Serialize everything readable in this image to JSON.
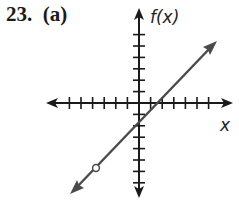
{
  "header": {
    "problem_label": "23.  (a)"
  },
  "colors": {
    "axis": "#1a1a1a",
    "line": "#4a4a4a",
    "background": "#ffffff"
  },
  "chart_data": {
    "type": "line",
    "title": "23. (a)",
    "xlabel": "x",
    "ylabel": "f(x)",
    "xlim": [
      -8,
      8
    ],
    "ylim": [
      -8,
      8
    ],
    "x_ticks_left": 6,
    "x_ticks_right": 6,
    "y_ticks_up": 6,
    "y_ticks_down": 7,
    "grid": false,
    "series": [
      {
        "name": "f(x)",
        "equation": "f(x) = x - 1",
        "slope": 1,
        "y_intercept": -1,
        "x_intercept": 1,
        "x": [
          -4,
          6
        ],
        "y": [
          -5,
          5
        ],
        "open_point": [
          -4,
          -5
        ],
        "arrows": "both"
      }
    ]
  }
}
